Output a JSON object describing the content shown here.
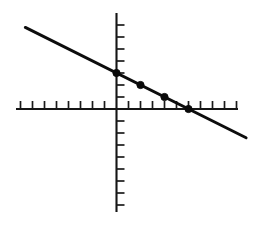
{
  "figure": {
    "title": "",
    "background_color": "#ffffff",
    "width": 258,
    "height": 225
  },
  "chart_data": {
    "type": "line",
    "title": "",
    "subtitle": "",
    "xlabel": "",
    "ylabel": "",
    "grid": false,
    "legend": false,
    "legend_position": "none",
    "equation": "y = -0.5x + 3",
    "slope": -0.5,
    "intercept": 3,
    "x_intercept": 6,
    "xlim": [
      -8.3,
      10.2
    ],
    "ylim": [
      -8.3,
      7.9
    ],
    "x_tick_interval": 1,
    "y_tick_interval": 1,
    "x_ticks": [
      -8,
      -7,
      -6,
      -5,
      -4,
      -3,
      -2,
      -1,
      1,
      2,
      3,
      4,
      5,
      6,
      7,
      8,
      9,
      10
    ],
    "y_ticks": [
      -8,
      -7,
      -6,
      -5,
      -4,
      -3,
      -2,
      -1,
      1,
      2,
      3,
      4,
      5,
      6,
      7
    ],
    "tick_labels_visible": false,
    "axis_labels_visible": false,
    "line_segment": {
      "x_start": -7.6,
      "y_start": 6.8,
      "x_end": 10.8,
      "y_end": -2.4
    },
    "series": [
      {
        "name": "points",
        "marker": "filled-circle",
        "marker_color": "#0a0a0a",
        "line_color": "#0d0d0d",
        "x": [
          0,
          2,
          4,
          6
        ],
        "y": [
          3,
          2,
          1,
          0
        ],
        "points": [
          {
            "label": "point-1",
            "x": 0,
            "y": 3
          },
          {
            "label": "point-2",
            "x": 2,
            "y": 2
          },
          {
            "label": "point-3",
            "x": 4,
            "y": 1
          },
          {
            "label": "point-4",
            "x": 6,
            "y": 0
          }
        ]
      }
    ],
    "colors": {
      "axis": "#151515",
      "tick": "#1a1a1a",
      "line": "#0d0d0d",
      "marker": "#0a0a0a",
      "background": "#ffffff"
    }
  }
}
